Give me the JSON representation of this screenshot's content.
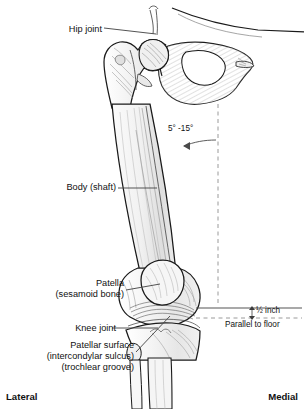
{
  "figure": {
    "colors": {
      "ink": "#1a1a1a",
      "bone_fill": "#f2f2f2",
      "bone_shade": "#d9d9d9",
      "leader": "#555555",
      "dashed": "#9a9a9a",
      "background": "#ffffff"
    }
  },
  "labels": {
    "hip_joint": "Hip joint",
    "body_shaft": "Body (shaft)",
    "patella_line1": "Patella",
    "patella_line2": "(sesamoid bone)",
    "knee_joint": "Knee joint",
    "patellar_surface_line1": "Patellar surface",
    "patellar_surface_line2": "(intercondylar sulcus)",
    "patellar_surface_line3": "(trochlear groove)",
    "angle": "5° -15°",
    "half_inch": "½ inch",
    "parallel_to_floor": "Parallel to floor",
    "lateral": "Lateral",
    "medial": "Medial"
  },
  "annotations": {
    "shaft_angle_range_degrees": [
      5,
      15
    ],
    "condyle_offset": "½ inch",
    "reference_line": "Parallel to floor",
    "orientation_left": "Lateral",
    "orientation_right": "Medial"
  }
}
